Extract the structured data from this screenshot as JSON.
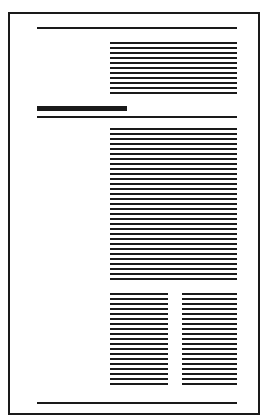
{
  "diagram": {
    "type": "page-layout-schematic",
    "colors": {
      "ink": "#1a1a1a",
      "paper": "#ffffff"
    },
    "page": {
      "x": 8,
      "y": 12,
      "width": 252,
      "height": 403
    },
    "top_rule": {
      "x": 37,
      "y": 27,
      "width": 200
    },
    "intro_block": {
      "x": 110,
      "y": 42,
      "width": 127,
      "lines": 11
    },
    "section_heading": {
      "x": 37,
      "y": 106,
      "width": 90
    },
    "section_rule": {
      "x": 37,
      "y": 116,
      "width": 200
    },
    "main_block": {
      "x": 110,
      "y": 128,
      "width": 127,
      "lines": 31
    },
    "columns": [
      {
        "x": 110,
        "y": 293,
        "width": 58,
        "lines": 19
      },
      {
        "x": 182,
        "y": 293,
        "width": 55,
        "lines": 19
      }
    ],
    "bottom_rule": {
      "x": 37,
      "y": 402,
      "width": 200
    }
  }
}
